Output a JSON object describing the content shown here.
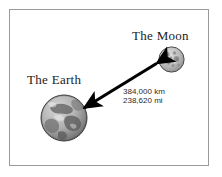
{
  "diagram": {
    "background_color": "#ffffff",
    "frame_color": "#9a9a9a",
    "arrow_color": "#000000",
    "bodies": {
      "moon": {
        "label": "The Moon",
        "icon": "moon-sphere-icon",
        "surface_color": "#b9b9b9"
      },
      "earth": {
        "label": "The Earth",
        "icon": "earth-sphere-icon",
        "surface_color": "#a8a8a8"
      }
    },
    "distance": {
      "metric": "384,000 km",
      "imperial": "238,620 mi"
    }
  }
}
